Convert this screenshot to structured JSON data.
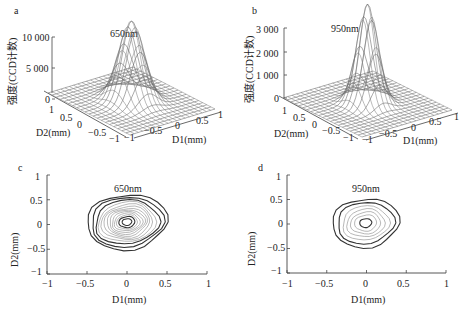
{
  "figure": {
    "panels": [
      {
        "id": "a",
        "letter": "a",
        "wavelength": "650nm",
        "zlabel": "强度(CCD计数)",
        "xlabel": "D1(mm)",
        "ylabel": "D2(mm)",
        "z_ticks": [
          "0",
          "5 000",
          "10 000"
        ],
        "x_ticks": [
          "−1",
          "−0.5",
          "0",
          "0.5",
          "1"
        ],
        "y_ticks": [
          "1",
          "0.5",
          "0",
          "−0.5",
          "−1"
        ]
      },
      {
        "id": "b",
        "letter": "b",
        "wavelength": "950nm",
        "zlabel": "强度(CCD计数)",
        "xlabel": "D1(mm)",
        "ylabel": "D2(mm)",
        "z_ticks": [
          "0",
          "1 000",
          "2 000",
          "3 000"
        ],
        "x_ticks": [
          "−1",
          "−0.5",
          "0",
          "0.5",
          "1"
        ],
        "y_ticks": [
          "1",
          "0.5",
          "0",
          "−0.5",
          "−1"
        ]
      },
      {
        "id": "c",
        "letter": "c",
        "wavelength": "650nm",
        "xlabel": "D1(mm)",
        "ylabel": "D2(mm)",
        "x_ticks": [
          "−1",
          "−0.5",
          "0",
          "0.5",
          "1"
        ],
        "y_ticks": [
          "1",
          "0.5",
          "0",
          "−0.5",
          "−1"
        ]
      },
      {
        "id": "d",
        "letter": "d",
        "wavelength": "950nm",
        "xlabel": "D1(mm)",
        "ylabel": "D2(mm)",
        "x_ticks": [
          "−1",
          "−0.5",
          "0",
          "0.5",
          "1"
        ],
        "y_ticks": [
          "1",
          "0.5",
          "0",
          "−0.5",
          "−1"
        ]
      }
    ]
  },
  "chart_data": [
    {
      "type": "surface",
      "panel": "a",
      "title": "650nm",
      "xlabel": "D1(mm)",
      "ylabel": "D2(mm)",
      "zlabel": "强度(CCD计数)",
      "xlim": [
        -1,
        1
      ],
      "ylim": [
        -1,
        1
      ],
      "zlim": [
        0,
        10000
      ],
      "peak": {
        "x": 0,
        "y": 0,
        "z": 10000
      },
      "shape": "2D Gaussian beam profile, FWHM ≈ 0.5 mm",
      "grid": true
    },
    {
      "type": "surface",
      "panel": "b",
      "title": "950nm",
      "xlabel": "D1(mm)",
      "ylabel": "D2(mm)",
      "zlabel": "强度(CCD计数)",
      "xlim": [
        -1,
        1
      ],
      "ylim": [
        -1,
        1
      ],
      "zlim": [
        0,
        3000
      ],
      "peak": {
        "x": 0,
        "y": 0,
        "z": 3200
      },
      "shape": "2D Gaussian beam profile, narrower, FWHM ≈ 0.4 mm",
      "grid": true
    },
    {
      "type": "contour",
      "panel": "c",
      "title": "650nm",
      "xlabel": "D1(mm)",
      "ylabel": "D2(mm)",
      "xlim": [
        -1,
        1
      ],
      "ylim": [
        -1,
        1
      ],
      "center": {
        "x": 0,
        "y": 0.05
      },
      "outer_extent": {
        "x": [
          -0.5,
          0.5
        ],
        "y": [
          -0.52,
          0.6
        ]
      },
      "num_contours": 12
    },
    {
      "type": "contour",
      "panel": "d",
      "title": "950nm",
      "xlabel": "D1(mm)",
      "ylabel": "D2(mm)",
      "xlim": [
        -1,
        1
      ],
      "ylim": [
        -1,
        1
      ],
      "center": {
        "x": 0,
        "y": 0.05
      },
      "outer_extent": {
        "x": [
          -0.43,
          0.4
        ],
        "y": [
          -0.47,
          0.5
        ]
      },
      "num_contours": 7
    }
  ]
}
